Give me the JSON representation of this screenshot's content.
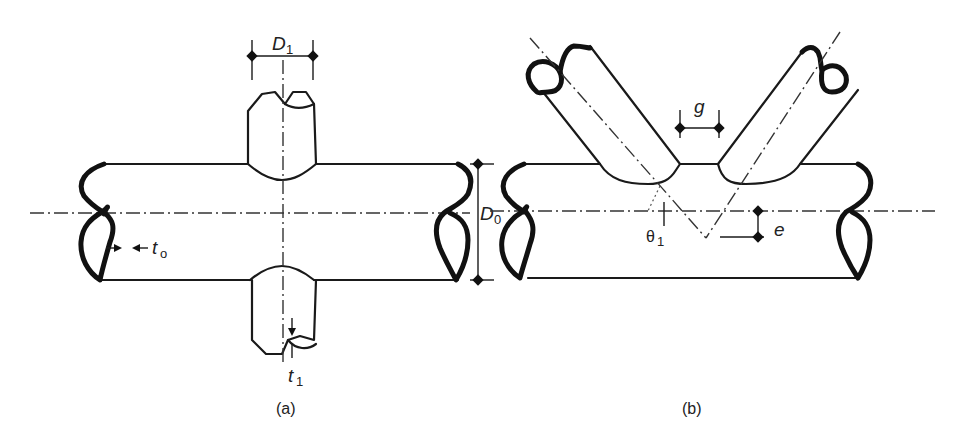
{
  "figure": {
    "panel_a": {
      "caption": "(a)",
      "labels": {
        "D1": {
          "main": "D",
          "sub": "1"
        },
        "D0": {
          "main": "D",
          "sub": "0"
        },
        "t0": {
          "main": "t",
          "sub": "o"
        },
        "t1": {
          "main": "t",
          "sub": "1"
        }
      },
      "description": "Cross (X) joint: chord tube with brace tubes above and below"
    },
    "panel_b": {
      "caption": "(b)",
      "labels": {
        "g": "g",
        "e": "e",
        "theta1": {
          "main": "θ",
          "sub": "1"
        }
      },
      "description": "K-gap joint: two inclined braces welded to chord with gap g and eccentricity e"
    },
    "colors": {
      "line": "#1a1a1a",
      "background": "#ffffff"
    }
  }
}
